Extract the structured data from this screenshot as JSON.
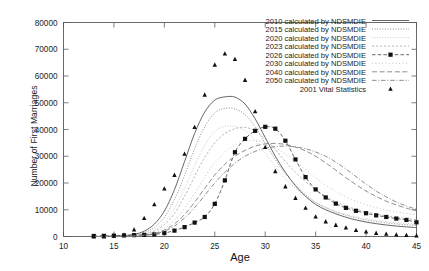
{
  "chart_data": {
    "type": "line",
    "title": "",
    "xlabel": "Age",
    "ylabel": "Number of First Marriages",
    "xlim": [
      10,
      45
    ],
    "ylim": [
      0,
      80000
    ],
    "xticks": [
      10,
      15,
      20,
      25,
      30,
      35,
      40,
      45
    ],
    "yticks": [
      0,
      10000,
      20000,
      30000,
      40000,
      50000,
      60000,
      70000,
      80000
    ],
    "xtick_labels": [
      "10",
      "15",
      "20",
      "25",
      "30",
      "35",
      "40",
      "45"
    ],
    "ytick_labels": [
      "0",
      "10000",
      "20000",
      "30000",
      "40000",
      "50000",
      "60000",
      "70000",
      "80000"
    ],
    "grid": false,
    "legend_position": "top-right",
    "x": [
      13,
      14,
      15,
      16,
      17,
      18,
      19,
      20,
      21,
      22,
      23,
      24,
      25,
      26,
      27,
      28,
      29,
      30,
      31,
      32,
      33,
      34,
      35,
      36,
      37,
      38,
      39,
      40,
      41,
      42,
      43,
      44,
      45
    ],
    "series": [
      {
        "name": "2010 calculated by NDSMDIE",
        "style": "solid",
        "marker": "none",
        "values": [
          0,
          0,
          100,
          300,
          800,
          2000,
          4600,
          9500,
          17500,
          28000,
          38500,
          46500,
          51000,
          52200,
          52100,
          49500,
          44000,
          37000,
          30000,
          24000,
          19000,
          15000,
          12000,
          10000,
          8500,
          7200,
          6200,
          5400,
          4800,
          4300,
          3900,
          3600,
          3300
        ]
      },
      {
        "name": "2015 calculated by NDSMDIE",
        "style": "dotted",
        "marker": "none",
        "values": [
          0,
          0,
          60,
          200,
          600,
          1500,
          3400,
          7200,
          13800,
          22800,
          32800,
          41000,
          46200,
          47900,
          47700,
          45500,
          41000,
          34800,
          28800,
          23500,
          19200,
          15600,
          12800,
          10800,
          9200,
          8000,
          7000,
          6200,
          5600,
          5100,
          4700,
          4400,
          4100
        ]
      },
      {
        "name": "2020 calculated by NDSMDIE",
        "style": "fine-dotted",
        "marker": "none",
        "values": [
          0,
          0,
          40,
          140,
          420,
          1100,
          2500,
          5400,
          10500,
          18000,
          26500,
          34000,
          39200,
          41200,
          41100,
          39500,
          36000,
          31000,
          26000,
          21600,
          18000,
          15000,
          12600,
          10800,
          9400,
          8300,
          7400,
          6700,
          6100,
          5600,
          5200,
          4900,
          4600
        ]
      },
      {
        "name": "2023 calculated by NDSMDIE",
        "style": "dashed-fine",
        "marker": "none",
        "values": [
          0,
          0,
          30,
          110,
          340,
          900,
          2000,
          4400,
          8600,
          15000,
          22500,
          29500,
          35000,
          38500,
          40300,
          40800,
          39500,
          36500,
          32500,
          28000,
          24000,
          20500,
          17500,
          15000,
          13000,
          11400,
          10200,
          9200,
          8400,
          7700,
          7100,
          6700,
          6300
        ]
      },
      {
        "name": "2026 calculated by NDSMDIE",
        "style": "dashed",
        "marker": "square",
        "values": [
          200,
          250,
          300,
          400,
          500,
          600,
          800,
          1300,
          2200,
          3500,
          5200,
          7300,
          12200,
          21000,
          31500,
          36500,
          39500,
          41000,
          40300,
          35800,
          28800,
          22200,
          17600,
          14600,
          12300,
          10700,
          9600,
          8700,
          7900,
          7300,
          6700,
          6200,
          5300
        ]
      },
      {
        "name": "2030 calculated by NDSMDIE",
        "style": "dotted-sparse",
        "marker": "none",
        "values": [
          0,
          0,
          20,
          70,
          220,
          600,
          1400,
          3000,
          6000,
          10500,
          16200,
          22200,
          27500,
          31500,
          34200,
          35600,
          35800,
          35000,
          33200,
          30800,
          28000,
          25000,
          22000,
          19200,
          16800,
          14800,
          13200,
          11900,
          10800,
          9900,
          9200,
          8600,
          8100
        ]
      },
      {
        "name": "2040 calculated by NDSMDIE",
        "style": "dashed-long",
        "marker": "none",
        "values": [
          0,
          0,
          15,
          55,
          170,
          460,
          1100,
          2400,
          4700,
          8200,
          12800,
          18000,
          23000,
          27000,
          30000,
          32200,
          33800,
          34600,
          34800,
          34400,
          33400,
          32000,
          30000,
          27500,
          24800,
          22000,
          19400,
          17000,
          15000,
          13200,
          11800,
          10600,
          9600
        ]
      },
      {
        "name": "2050 calculated by NDSMDIE",
        "style": "dash-dot",
        "marker": "none",
        "values": [
          0,
          0,
          10,
          45,
          140,
          380,
          900,
          2000,
          3900,
          6900,
          10800,
          15400,
          20000,
          24000,
          27400,
          30000,
          31800,
          33000,
          33600,
          33800,
          33500,
          32800,
          31600,
          30000,
          27800,
          25200,
          22400,
          19600,
          17000,
          14800,
          12900,
          11400,
          10200
        ]
      },
      {
        "name": "2001 Vital Statistics",
        "style": "none",
        "marker": "triangle",
        "values": [
          0,
          0,
          200,
          600,
          2600,
          6900,
          12000,
          17900,
          23000,
          30900,
          40900,
          53000,
          64200,
          68400,
          66300,
          58500,
          46800,
          33400,
          24400,
          18700,
          14400,
          10700,
          7400,
          5600,
          4300,
          3300,
          2400,
          1800,
          1300,
          1000,
          700,
          500,
          300
        ]
      }
    ]
  },
  "legend": {
    "entries": [
      {
        "label": "2010 calculated by NDSMDIE"
      },
      {
        "label": "2015 calculated by NDSMDIE"
      },
      {
        "label": "2020 calculated by NDSMDIE"
      },
      {
        "label": "2023 calculated by NDSMDIE"
      },
      {
        "label": "2026 calculated by NDSMDIE"
      },
      {
        "label": "2030 calculated by NDSMDIE"
      },
      {
        "label": "2040 calculated by NDSMDIE"
      },
      {
        "label": "2050 calculated by NDSMDIE"
      },
      {
        "label": "2001 Vital Statistics"
      }
    ]
  },
  "colors": {
    "line": "#7a7a7a",
    "line_dark": "#4a4a4a",
    "line_light": "#a9a9a9",
    "axis": "#5a5a5a",
    "text": "#1a1a1a",
    "background": "#ffffff"
  }
}
